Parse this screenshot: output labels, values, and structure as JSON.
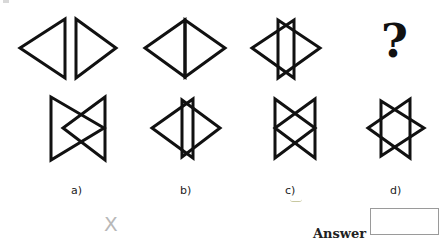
{
  "question": {
    "missing_symbol": "?",
    "stroke_color": "#111111",
    "top_row": [
      {
        "name": "pair-separated",
        "polygons": [
          [
            [
              20,
              48
            ],
            [
              65,
              19
            ],
            [
              65,
              78
            ]
          ],
          [
            [
              76,
              19
            ],
            [
              76,
              78
            ],
            [
              116,
              48
            ]
          ]
        ]
      },
      {
        "name": "pair-joined-diamond",
        "polygons": [
          [
            [
              145,
              48
            ],
            [
              185,
              20
            ],
            [
              185,
              77
            ]
          ],
          [
            [
              185,
              20
            ],
            [
              225,
              48
            ],
            [
              185,
              77
            ]
          ]
        ]
      },
      {
        "name": "pair-overlapping",
        "polygons": [
          [
            [
              252,
              48
            ],
            [
              294,
              20
            ],
            [
              294,
              78
            ]
          ],
          [
            [
              278,
              20
            ],
            [
              278,
              78
            ],
            [
              320,
              48
            ]
          ]
        ]
      }
    ],
    "bottom_row": [
      {
        "name": "option-a",
        "polygons": [
          [
            [
              51,
              97
            ],
            [
              51,
              160
            ],
            [
              104,
              128
            ]
          ],
          [
            [
              105,
              97
            ],
            [
              105,
              160
            ],
            [
              63,
              128
            ]
          ]
        ]
      },
      {
        "name": "option-b",
        "polygons": [
          [
            [
              152,
              128
            ],
            [
              193,
              99
            ],
            [
              193,
              158
            ]
          ],
          [
            [
              182,
              100
            ],
            [
              182,
              157
            ],
            [
              220,
              128
            ]
          ]
        ]
      },
      {
        "name": "option-c",
        "polygons": [
          [
            [
              275,
              99
            ],
            [
              275,
              158
            ],
            [
              315,
              128
            ]
          ],
          [
            [
              315,
              99
            ],
            [
              315,
              158
            ],
            [
              275,
              128
            ]
          ]
        ]
      },
      {
        "name": "option-d",
        "polygons": [
          [
            [
              368,
              128
            ],
            [
              410,
              99
            ],
            [
              410,
              158
            ]
          ],
          [
            [
              381,
              101
            ],
            [
              381,
              156
            ],
            [
              424,
              128
            ]
          ]
        ]
      }
    ]
  },
  "options": [
    {
      "label": "a)",
      "x": 78
    },
    {
      "label": "b)",
      "x": 187
    },
    {
      "label": "c)",
      "x": 292
    },
    {
      "label": "d)",
      "x": 397
    }
  ],
  "scribble": "X",
  "answer": {
    "label": "Answer",
    "value": ""
  }
}
